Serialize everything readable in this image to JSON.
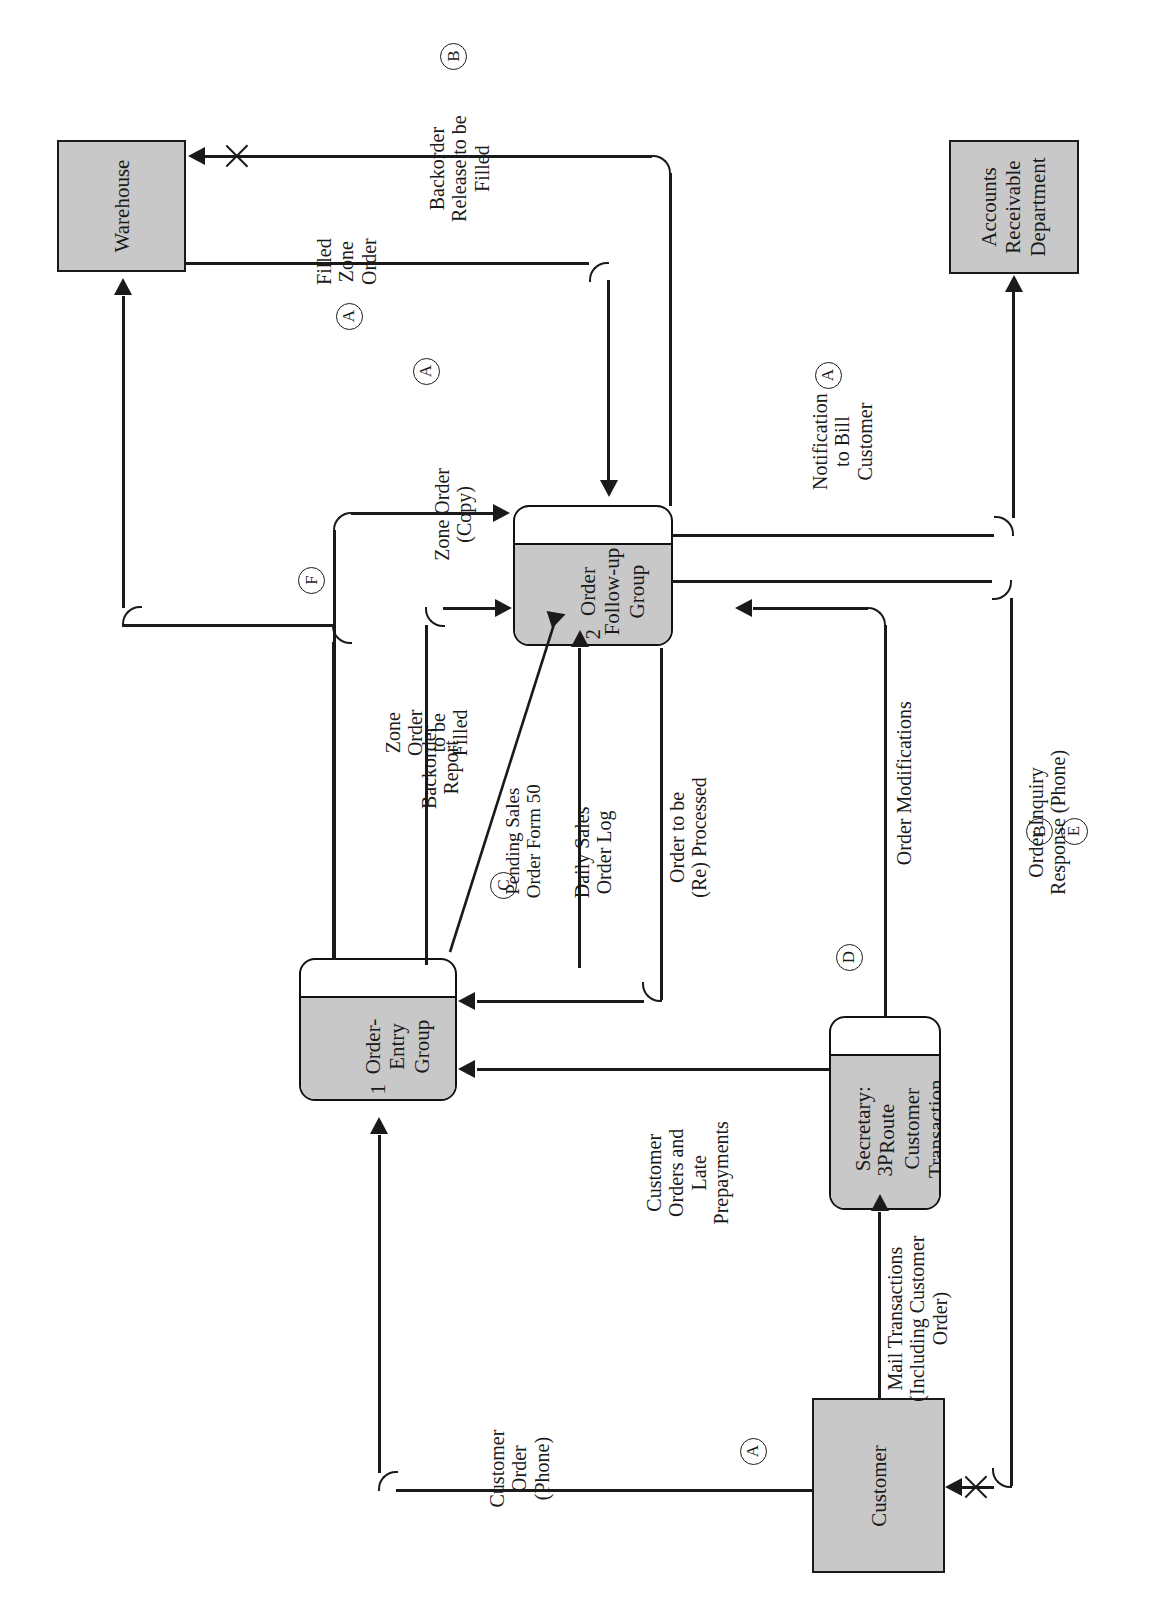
{
  "diagram": {
    "type": "data-flow-diagram",
    "orientation": "rotated-90-counterclockwise",
    "colors": {
      "entity_fill": "#c8c8c8",
      "process_fill": "#c8c8c8",
      "line": "#1a1a1a",
      "page_background": "#ffffff"
    }
  },
  "entities": [
    {
      "id": "warehouse",
      "label": "Warehouse"
    },
    {
      "id": "accounts_receivable",
      "label": "Accounts\nReceivable\nDepartment",
      "line1": "Accounts",
      "line2": "Receivable",
      "line3": "Department"
    },
    {
      "id": "customer",
      "label": "Customer"
    }
  ],
  "processes": [
    {
      "id": "p1",
      "number": "1",
      "name_line1": "Order-",
      "name_line2": "Entry",
      "name_line3": "Group"
    },
    {
      "id": "p2",
      "number": "2",
      "name_line1": "Order",
      "name_line2": "Follow-up",
      "name_line3": "Group"
    },
    {
      "id": "p3",
      "number": "3P",
      "name_line1": "Secretary:",
      "name_line2": "Route",
      "name_line3": "Customer",
      "name_line4": "Transaction"
    }
  ],
  "flows": [
    {
      "id": "backorder_release",
      "line1": "Backorder",
      "line2": "Release to be",
      "line3": "Filled",
      "ref": "B",
      "from": "p2",
      "to": "warehouse"
    },
    {
      "id": "filled_zone_order",
      "line1": "Filled",
      "line2": "Zone",
      "line3": "Order",
      "ref": "A",
      "from": "warehouse",
      "to": "p2"
    },
    {
      "id": "notification_to_bill",
      "line1": "Notification",
      "line2": "to Bill",
      "line3": "Customer",
      "ref": "A",
      "from": "p2",
      "to": "accounts_receivable"
    },
    {
      "id": "zone_order_copy",
      "line1": "Zone Order",
      "line2": "(Copy)",
      "ref": "",
      "from": "p1",
      "to": "p2"
    },
    {
      "id": "zone_order_to_be_filled",
      "line1": "Zone",
      "line2": "Order",
      "line3": "to be",
      "line4": "Filled",
      "ref": "A",
      "from": "p1",
      "to": "warehouse"
    },
    {
      "id": "backorder_report",
      "line1": "Backorder",
      "line2": "Report",
      "ref": "",
      "from": "p1",
      "to": "p2"
    },
    {
      "id": "pending_sales_order_form",
      "line1": "Pending Sales",
      "line2": "Order Form 50",
      "ref": "C",
      "from": "p1",
      "to": "p2"
    },
    {
      "id": "daily_sales_order_log",
      "line1": "Daily Sales",
      "line2": "Order Log",
      "ref": "",
      "from": "p1",
      "to": "p2"
    },
    {
      "id": "order_to_be_reprocessed",
      "line1": "Order to be",
      "line2": "(Re) Processed",
      "ref": "",
      "from": "p2",
      "to": "p1"
    },
    {
      "id": "order_modifications",
      "line1": "Order Modifications",
      "ref": "",
      "from": "p3",
      "to": "p2"
    },
    {
      "id": "order_inquiry_response",
      "line1": "Order Inquiry",
      "line2": "Response (Phone)",
      "ref": "B",
      "ref2": "E",
      "from": "p2",
      "to": "customer"
    },
    {
      "id": "customer_orders_and_late_prepayments",
      "line1": "Customer",
      "line2": "Orders and",
      "line3": "Late",
      "line4": "Prepayments",
      "ref": "",
      "from": "p3",
      "to": "p1"
    },
    {
      "id": "mail_transactions",
      "line1": "Mail Transactions",
      "line2": "(Including Customer",
      "line3": "Order)",
      "ref": "",
      "from": "customer",
      "to": "p3"
    },
    {
      "id": "customer_order_phone",
      "line1": "Customer",
      "line2": "Order",
      "line3": "(Phone)",
      "ref": "A",
      "from": "customer",
      "to": "p1"
    }
  ],
  "markers": [
    {
      "id": "ref_f",
      "letter": "F"
    },
    {
      "id": "ref_d",
      "letter": "D"
    }
  ]
}
